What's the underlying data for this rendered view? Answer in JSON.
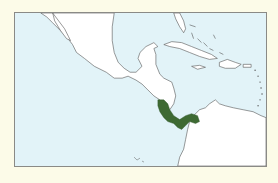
{
  "map": {
    "title": "",
    "region": "Central America and Caribbean",
    "colors": {
      "page_background": "#fcfbe8",
      "water": "#e2f3f8",
      "land": "#ffffff",
      "coastline": "#555555",
      "frame": "#8a8a86",
      "range": "#3e6a33"
    },
    "highlighted_range": {
      "description": "Distribution range",
      "areas": [
        "Costa Rica",
        "Panama"
      ]
    }
  }
}
